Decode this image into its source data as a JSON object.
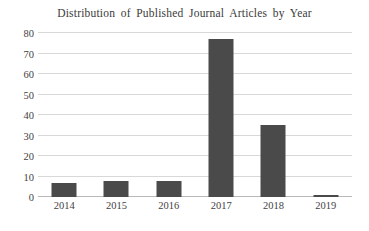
{
  "chart_data": {
    "type": "bar",
    "title": "Distribution  of Published  Journal  Articles  by Year",
    "xlabel": "",
    "ylabel": "",
    "categories": [
      "2014",
      "2015",
      "2016",
      "2017",
      "2018",
      "2019"
    ],
    "values": [
      7,
      8,
      8,
      77,
      35,
      1
    ],
    "ylim": [
      0,
      80
    ],
    "yticks": [
      0,
      10,
      20,
      30,
      40,
      50,
      60,
      70,
      80
    ],
    "ytick_labels": [
      "0",
      "10",
      "20",
      "30",
      "40",
      "50",
      "60",
      "70",
      "80"
    ],
    "grid": "horizontal",
    "legend": "none",
    "series": [
      {
        "name": "Published Journal Articles",
        "values": [
          7,
          8,
          8,
          77,
          35,
          1
        ]
      }
    ],
    "colors": {
      "bar_fill": "#4a4a4a",
      "gridline": "#d8d8d8",
      "baseline": "#b9b9b9",
      "background": "#ffffff",
      "text": "#3f3f3f"
    }
  }
}
